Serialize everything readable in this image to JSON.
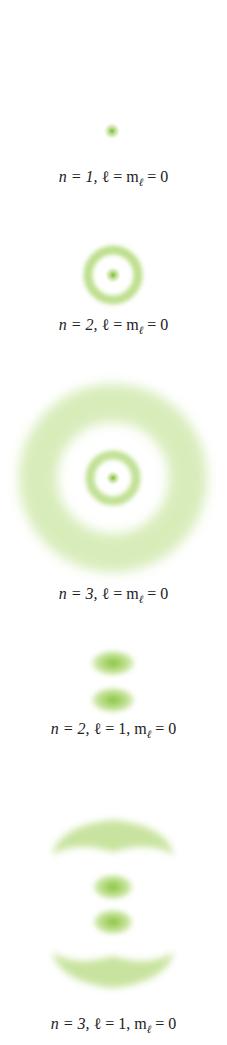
{
  "figure": {
    "color": "#8cc63f",
    "orbitals": [
      {
        "id": "1s",
        "n": "1",
        "l": "",
        "ml": "0",
        "label_n": "n = 1,",
        "label_rest": "ℓ = m",
        "label_sub": "ℓ",
        "label_end": " = 0",
        "full_label": "n = 1, ℓ = mℓ = 0"
      },
      {
        "id": "2s",
        "n": "2",
        "label_n": "n = 2,",
        "label_rest": "ℓ = m",
        "label_sub": "ℓ",
        "label_end": " = 0",
        "full_label": "n = 2, ℓ = mℓ = 0"
      },
      {
        "id": "3s",
        "n": "3",
        "label_n": "n = 3,",
        "label_rest": "ℓ = m",
        "label_sub": "ℓ",
        "label_end": " = 0",
        "full_label": "n = 3, ℓ = mℓ = 0"
      },
      {
        "id": "2p",
        "n": "2",
        "label_n": "n = 2,",
        "label_rest": "ℓ = 1, m",
        "label_sub": "ℓ",
        "label_end": " = 0",
        "full_label": "n = 2, ℓ = 1, mℓ = 0"
      },
      {
        "id": "3p",
        "n": "3",
        "label_n": "n = 3,",
        "label_rest": "ℓ = 1, m",
        "label_sub": "ℓ",
        "label_end": " = 0",
        "full_label": "n = 3, ℓ = 1, mℓ = 0"
      }
    ]
  }
}
